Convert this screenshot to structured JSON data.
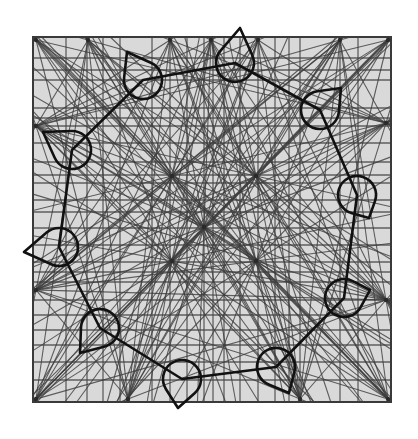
{
  "figure": {
    "title": "",
    "paper": {
      "x": 33,
      "y": 37,
      "width": 358,
      "height": 365,
      "color": "#d9d9d9"
    },
    "line_color": "#3d3d3d",
    "outline_color": "#111111"
  },
  "grid": {
    "vertical_x": [
      33,
      66,
      87,
      103,
      120,
      152,
      170,
      187,
      204,
      213,
      224,
      240,
      258,
      275,
      289,
      300,
      340,
      358,
      391
    ],
    "horizontal_y": [
      37,
      58,
      70,
      80,
      108,
      118,
      126,
      143,
      162,
      175,
      183,
      200,
      212,
      228,
      245,
      262,
      272,
      282,
      300,
      315,
      330,
      345,
      362,
      380,
      402
    ]
  },
  "fan_centers": [
    {
      "x": 36,
      "y": 40
    },
    {
      "x": 388,
      "y": 40
    },
    {
      "x": 36,
      "y": 399
    },
    {
      "x": 388,
      "y": 399
    },
    {
      "x": 36,
      "y": 126
    },
    {
      "x": 386,
      "y": 123
    },
    {
      "x": 211,
      "y": 40
    },
    {
      "x": 204,
      "y": 227
    },
    {
      "x": 172,
      "y": 176
    },
    {
      "x": 256,
      "y": 176
    },
    {
      "x": 172,
      "y": 261
    },
    {
      "x": 256,
      "y": 261
    },
    {
      "x": 88,
      "y": 40
    },
    {
      "x": 170,
      "y": 40
    },
    {
      "x": 258,
      "y": 40
    },
    {
      "x": 340,
      "y": 40
    },
    {
      "x": 36,
      "y": 290
    },
    {
      "x": 386,
      "y": 300
    },
    {
      "x": 128,
      "y": 399
    },
    {
      "x": 300,
      "y": 399
    }
  ],
  "ring": {
    "vertices": [
      {
        "x": 143,
        "y": 80
      },
      {
        "x": 235,
        "y": 63
      },
      {
        "x": 320,
        "y": 110
      },
      {
        "x": 357,
        "y": 195
      },
      {
        "x": 344,
        "y": 298
      },
      {
        "x": 276,
        "y": 367
      },
      {
        "x": 182,
        "y": 379
      },
      {
        "x": 100,
        "y": 328
      },
      {
        "x": 59,
        "y": 247
      },
      {
        "x": 72,
        "y": 150
      }
    ]
  },
  "teardrops": [
    {
      "cx": 143,
      "cy": 80,
      "tip_x": 127,
      "tip_y": 52,
      "r": 19
    },
    {
      "cx": 235,
      "cy": 63,
      "tip_x": 240,
      "tip_y": 28,
      "r": 19
    },
    {
      "cx": 320,
      "cy": 110,
      "tip_x": 341,
      "tip_y": 88,
      "r": 19
    },
    {
      "cx": 357,
      "cy": 195,
      "tip_x": 369,
      "tip_y": 218,
      "r": 19
    },
    {
      "cx": 344,
      "cy": 298,
      "tip_x": 370,
      "tip_y": 290,
      "r": 19
    },
    {
      "cx": 276,
      "cy": 367,
      "tip_x": 289,
      "tip_y": 393,
      "r": 19
    },
    {
      "cx": 182,
      "cy": 379,
      "tip_x": 178,
      "tip_y": 408,
      "r": 19
    },
    {
      "cx": 100,
      "cy": 328,
      "tip_x": 80,
      "tip_y": 353,
      "r": 19
    },
    {
      "cx": 59,
      "cy": 247,
      "tip_x": 24,
      "tip_y": 252,
      "r": 19
    },
    {
      "cx": 72,
      "cy": 150,
      "tip_x": 43,
      "tip_y": 132,
      "r": 19
    }
  ]
}
